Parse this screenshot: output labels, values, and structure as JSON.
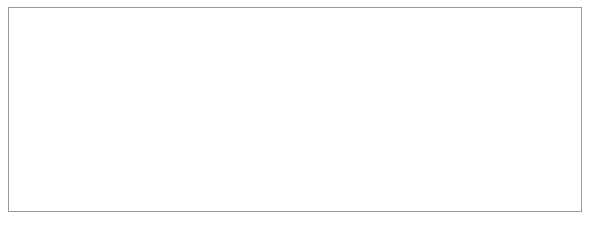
{
  "figure": {
    "background": "#ffffff",
    "frame_color": "#9a9a9a",
    "line_color": "#7c7f83",
    "axis_color": "#55585c",
    "text_color": "#2b2b2b"
  },
  "axes": {
    "y_title": "Sunspot number",
    "y_ticks": [
      200,
      160,
      120,
      80,
      40
    ],
    "y_tick_labels": [
      "200",
      "160",
      "120",
      "80",
      "40"
    ],
    "x_major_labels": [
      "1700",
      "1800",
      "1900",
      "2000"
    ],
    "x_minor_labels": [
      "10",
      "20",
      "30",
      "40",
      "50",
      "60",
      "70",
      "80",
      "90"
    ]
  },
  "chart_data": {
    "type": "line",
    "title": "",
    "subtitle": "",
    "xlabel": "",
    "ylabel": "Sunspot number",
    "xlim": [
      1700,
      2000
    ],
    "ylim": [
      0,
      200
    ],
    "grid": false,
    "legend": null,
    "x_tick_step": 10,
    "y_tick_step": 40,
    "series": [
      {
        "name": "Annual mean sunspot number",
        "color": "#7c7f83",
        "x_start": 1700,
        "x_step": 1,
        "values": [
          5,
          11,
          16,
          23,
          36,
          58,
          29,
          20,
          10,
          8,
          3,
          0,
          0,
          2,
          11,
          27,
          47,
          63,
          60,
          39,
          28,
          26,
          22,
          11,
          21,
          40,
          78,
          122,
          103,
          73,
          47,
          35,
          11,
          5,
          16,
          34,
          70,
          81,
          111,
          101,
          73,
          40,
          20,
          16,
          5,
          11,
          22,
          40,
          60,
          80.9,
          83.4,
          47.7,
          47.8,
          30.7,
          12.2,
          9.6,
          10.2,
          32.4,
          47.6,
          54,
          62.9,
          85.9,
          61.2,
          45.1,
          36.4,
          20.9,
          11.4,
          37.8,
          69.8,
          106.1,
          100.8,
          81.6,
          66.5,
          34.8,
          30.6,
          7,
          19.8,
          92.5,
          154.4,
          125.9,
          84.8,
          68.1,
          38.5,
          22.8,
          10.2,
          24.1,
          82.9,
          132,
          130.9,
          118.1,
          89.9,
          66.6,
          60,
          46.9,
          41,
          21.3,
          16,
          6.4,
          4.1,
          6.8,
          14.5,
          34,
          45,
          43.1,
          47.5,
          42.2,
          28.1,
          10.1,
          8.1,
          2.5,
          0,
          1.4,
          5,
          12.2,
          13.9,
          35.4,
          45.8,
          41.1,
          30.1,
          23.9,
          15.6,
          6.6,
          4,
          1.8,
          8.5,
          16.6,
          36.3,
          49.6,
          64.2,
          67,
          70.9,
          47.8,
          27.5,
          8.5,
          13.2,
          56.9,
          121.5,
          138.3,
          103.2,
          85.7,
          64.6,
          36.7,
          24.2,
          10.7,
          15,
          40.1,
          61.5,
          98.5,
          124.7,
          96.3,
          66.6,
          64.5,
          54.1,
          39,
          20.6,
          6.7,
          4.3,
          22.7,
          54.8,
          93.8,
          95.8,
          77.2,
          59.1,
          44,
          47,
          30.5,
          16.3,
          7.3,
          37.6,
          74,
          139,
          111.2,
          101.6,
          66.2,
          44.7,
          17,
          11.3,
          12.4,
          3.4,
          6,
          32.3,
          54.3,
          59.7,
          63.7,
          63.5,
          52.2,
          25.4,
          13.1,
          6.8,
          6.3,
          7.1,
          35.6,
          73,
          85.1,
          78,
          64,
          41.8,
          26.2,
          26.7,
          12.1,
          9.5,
          2.7,
          5,
          24.4,
          42,
          63.5,
          53.8,
          62,
          48.5,
          43.9,
          18.6,
          5.7,
          3.6,
          1.4,
          9.6,
          47.4,
          57.1,
          103.9,
          80.6,
          63.6,
          37.6,
          26.1,
          14.2,
          5.8,
          16.7,
          44.3,
          63.9,
          69,
          77.8,
          64.9,
          35.7,
          21.2,
          11.1,
          5.7,
          8.7,
          36.1,
          79.7,
          114.4,
          109.6,
          88.8,
          67.8,
          47.5,
          30.6,
          16.3,
          9.6,
          33.2,
          92.6,
          151.6,
          136.3,
          134.7,
          83.9,
          69.4,
          31.5,
          13.9,
          4.4,
          38,
          141.7,
          190.2,
          184.8,
          159,
          112.3,
          53.9,
          37.6,
          27.9,
          10.2,
          15.1,
          47,
          93.8,
          105.9,
          105.5,
          104.5,
          66.6,
          68.9,
          38,
          34.5,
          15.5,
          12.6,
          27.5,
          92.5,
          155.4,
          154.6,
          140.4,
          115.9,
          66.6,
          45.9,
          17.9,
          13.4,
          29.4,
          100.2,
          157.6,
          142.6,
          145.7,
          94.3,
          54.6,
          29.9,
          17.5,
          8.6,
          21.5,
          64.3,
          93.3
        ]
      }
    ]
  }
}
